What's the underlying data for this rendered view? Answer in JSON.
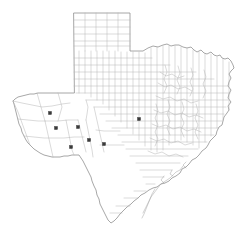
{
  "figure": {
    "region_label": "Texas",
    "background_color": "#ffffff",
    "county_line_color": "#b4b4b4",
    "state_outline_color": "#8a8a8a",
    "marker_color": "#3a3a3a",
    "marker_shape": "square",
    "marker_count": 7
  },
  "markers": [
    {
      "id": "marker-1",
      "label": "",
      "x": 50,
      "y": 113,
      "region": "west-texas"
    },
    {
      "id": "marker-2",
      "label": "",
      "x": 56,
      "y": 128,
      "region": "west-texas"
    },
    {
      "id": "marker-3",
      "label": "",
      "x": 78,
      "y": 127,
      "region": "west-texas"
    },
    {
      "id": "marker-4",
      "label": "",
      "x": 89,
      "y": 140,
      "region": "west-texas"
    },
    {
      "id": "marker-5",
      "label": "",
      "x": 71,
      "y": 147,
      "region": "west-texas"
    },
    {
      "id": "marker-6",
      "label": "",
      "x": 104,
      "y": 144,
      "region": "southwest-texas"
    },
    {
      "id": "marker-7",
      "label": "",
      "x": 139,
      "y": 119,
      "region": "central-texas"
    }
  ],
  "state_outline_path": "M 74 13 L 130 13 L 130 51 L 143 51 L 152 46 L 160 47 L 166 44 L 172 46 L 178 45 L 184 48 L 190 47 L 196 52 L 200 50 L 205 54 L 210 52 L 214 56 L 219 55 L 222 59 L 227 58 L 231 62 L 234 66 L 229 72 L 231 78 L 228 84 L 231 90 L 228 96 L 231 101 L 227 106 L 229 112 L 224 117 L 222 124 L 217 128 L 216 135 L 210 140 L 207 147 L 201 151 L 198 157 L 192 160 L 188 166 L 182 169 L 179 175 L 173 177 L 169 182 L 163 183 L 158 187 L 152 188 L 147 192 L 142 194 L 137 199 L 132 202 L 128 207 L 123 210 L 119 215 L 115 219 L 111 222 L 107 219 L 104 214 L 101 208 L 99 202 L 97 196 L 95 190 L 93 184 L 91 178 L 88 173 L 85 168 L 82 163 L 79 158 L 76 155 L 71 155 L 65 156 L 59 157 L 53 157 L 47 156 L 41 154 L 36 151 L 31 147 L 27 142 L 24 137 L 21 131 L 19 125 L 18 119 L 16 113 L 14 107 L 13 101 L 16 98 L 21 96 L 27 95 L 33 94 L 39 93 L 45 93 L 51 93 L 57 93 L 63 93 L 69 93 L 74 93 Z",
  "panhandle_grid": {
    "left": 74,
    "top": 13,
    "right": 130,
    "bottom": 51,
    "columns": 5,
    "rows": 6
  },
  "labels_visible": []
}
